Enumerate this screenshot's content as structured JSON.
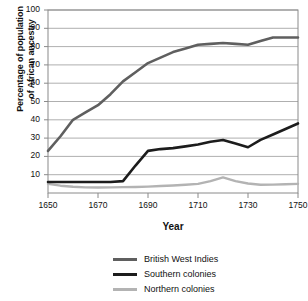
{
  "chart_data": {
    "type": "line",
    "title": "",
    "xlabel": "Year",
    "ylabel": "Percentage of population of African ancestry",
    "ylabel_line1": "Percentage of population",
    "ylabel_line2": "of African ancestry",
    "xlim": [
      1650,
      1750
    ],
    "ylim": [
      0,
      100
    ],
    "grid": true,
    "legend_position": "below",
    "y_ticks": [
      100,
      90,
      80,
      70,
      60,
      50,
      40,
      30,
      20,
      10
    ],
    "x_ticks": [
      1650,
      1670,
      1690,
      1710,
      1730,
      1750
    ],
    "x": [
      1650,
      1655,
      1660,
      1665,
      1670,
      1675,
      1680,
      1685,
      1690,
      1695,
      1700,
      1705,
      1710,
      1715,
      1720,
      1725,
      1730,
      1735,
      1740,
      1745,
      1750
    ],
    "series": [
      {
        "name": "British West Indies",
        "color": "#5f5f5f",
        "values": [
          23,
          31,
          40,
          44,
          48,
          54,
          61,
          66,
          71,
          74,
          77,
          79,
          81,
          81.5,
          82,
          81.5,
          81,
          83,
          85,
          85,
          85
        ]
      },
      {
        "name": "Southern colonies",
        "color": "#1c1c1c",
        "values": [
          6,
          6,
          6,
          6,
          6,
          6,
          6.5,
          15,
          23,
          24,
          24.5,
          25.5,
          26.5,
          28,
          29,
          27,
          25,
          29,
          32,
          35,
          38
        ]
      },
      {
        "name": "Northern colonies",
        "color": "#b3b3b3",
        "values": [
          5,
          4,
          3.4,
          3.1,
          3,
          3.1,
          3.2,
          3.3,
          3.5,
          3.8,
          4.1,
          4.5,
          5,
          6.5,
          8.5,
          6.5,
          5.2,
          4.5,
          4.6,
          4.8,
          5
        ]
      }
    ]
  },
  "legend": {
    "items": [
      {
        "label": "British West Indies",
        "color": "#5f5f5f"
      },
      {
        "label": "Southern colonies",
        "color": "#1c1c1c"
      },
      {
        "label": "Northern colonies",
        "color": "#b3b3b3"
      }
    ]
  },
  "axes": {
    "y_title_line1": "Percentage of population",
    "y_title_line2": "of African ancestry",
    "x_title": "Year"
  }
}
